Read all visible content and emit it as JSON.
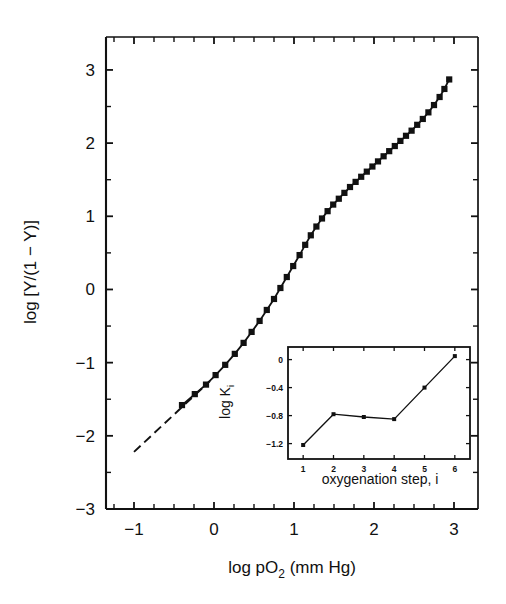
{
  "chart_data": {
    "type": "line",
    "title": "",
    "xlabel": "log pO2 (mm Hg)",
    "xlabel_main": "log pO",
    "xlabel_sub": "2",
    "xlabel_tail": " (mm Hg)",
    "ylabel": "log [Y/(1 − Y)]",
    "xlim": [
      -1.35,
      3.3
    ],
    "ylim": [
      -3.0,
      3.45
    ],
    "xticks": [
      -1,
      0,
      1,
      2,
      3
    ],
    "xtick_labels": [
      "−1",
      "0",
      "1",
      "2",
      "3"
    ],
    "yticks": [
      -3,
      -2,
      -1,
      0,
      1,
      2,
      3
    ],
    "ytick_labels": [
      "−3",
      "−2",
      "−1",
      "0",
      "1",
      "2",
      "3"
    ],
    "x_minor_step": 0.25,
    "y_minor_step": 0.5,
    "grid": false,
    "legend": "none",
    "series": [
      {
        "name": "Hill plot data",
        "marker": "filled-square",
        "x": [
          -0.4,
          -0.24,
          -0.1,
          0.02,
          0.14,
          0.26,
          0.37,
          0.47,
          0.57,
          0.66,
          0.75,
          0.83,
          0.91,
          0.99,
          1.07,
          1.14,
          1.21,
          1.28,
          1.35,
          1.42,
          1.49,
          1.56,
          1.63,
          1.7,
          1.77,
          1.84,
          1.91,
          1.98,
          2.05,
          2.12,
          2.19,
          2.26,
          2.33,
          2.4,
          2.47,
          2.54,
          2.61,
          2.68,
          2.75,
          2.82,
          2.88,
          2.94
        ],
        "y": [
          -1.58,
          -1.43,
          -1.3,
          -1.17,
          -1.03,
          -0.88,
          -0.73,
          -0.58,
          -0.43,
          -0.28,
          -0.13,
          0.02,
          0.17,
          0.32,
          0.47,
          0.61,
          0.74,
          0.86,
          0.97,
          1.07,
          1.16,
          1.24,
          1.32,
          1.4,
          1.47,
          1.54,
          1.61,
          1.68,
          1.75,
          1.82,
          1.89,
          1.96,
          2.03,
          2.1,
          2.17,
          2.25,
          2.33,
          2.42,
          2.52,
          2.63,
          2.74,
          2.87
        ]
      },
      {
        "name": "lower asymptote",
        "marker": "none",
        "style": "dashed",
        "x": [
          -1.0,
          -0.05
        ],
        "y": [
          -2.22,
          -1.25
        ]
      }
    ],
    "inset": {
      "type": "line",
      "xlabel": "oxygenation step, i",
      "ylabel": "log K_i",
      "ylabel_main": "log K",
      "ylabel_sub": "i",
      "xlim": [
        0.5,
        6.5
      ],
      "ylim": [
        -1.42,
        0.18
      ],
      "xticks": [
        1,
        2,
        3,
        4,
        5,
        6
      ],
      "xtick_labels": [
        "1",
        "2",
        "3",
        "4",
        "5",
        "6"
      ],
      "yticks": [
        0,
        -0.4,
        -0.8,
        -1.2
      ],
      "ytick_labels": [
        "0",
        "−0.4",
        "−0.8",
        "−1.2"
      ],
      "categories": [
        1,
        2,
        3,
        4,
        5,
        6
      ],
      "values": [
        -1.22,
        -0.78,
        -0.82,
        -0.85,
        -0.4,
        0.05
      ],
      "marker": "filled-square",
      "grid": false
    }
  },
  "style": {
    "line_color": "#111111",
    "marker_color": "#111111",
    "axis_color": "#111111",
    "background": "#ffffff"
  }
}
